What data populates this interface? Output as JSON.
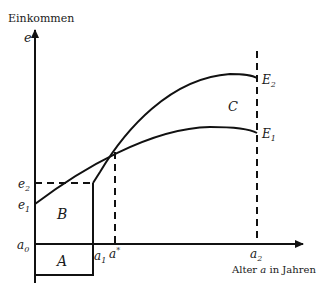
{
  "axes": {
    "y_label": "Einkommen",
    "y_symbol": "e",
    "x_label": "Alter a in Jahren",
    "x_label_prefix": "Alter ",
    "x_label_var": "a",
    "x_label_suffix": " in Jahren"
  },
  "ticks": {
    "e1": "e",
    "e1_sub": "1",
    "e2": "e",
    "e2_sub": "2",
    "a0": "a",
    "a0_sub": "0",
    "a1": "a",
    "a1_sub": "1",
    "astar": "a",
    "astar_sup": "*",
    "a2": "a",
    "a2_sub": "2"
  },
  "curves": {
    "E1": {
      "label": "E",
      "sub": "1"
    },
    "E2": {
      "label": "E",
      "sub": "2"
    }
  },
  "regions": {
    "A": "A",
    "B": "B",
    "C": "C"
  },
  "colors": {
    "stroke": "#111111",
    "background": "#ffffff"
  }
}
